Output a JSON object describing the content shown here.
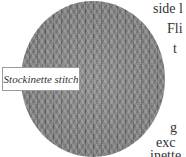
{
  "swatch": {
    "caption": "Stockinette stitch",
    "color": "#8a8a8a"
  },
  "body_text": {
    "lines": [
      "side l",
      "Fli",
      "t",
      "",
      "",
      "g",
      "exc",
      "inette"
    ]
  }
}
